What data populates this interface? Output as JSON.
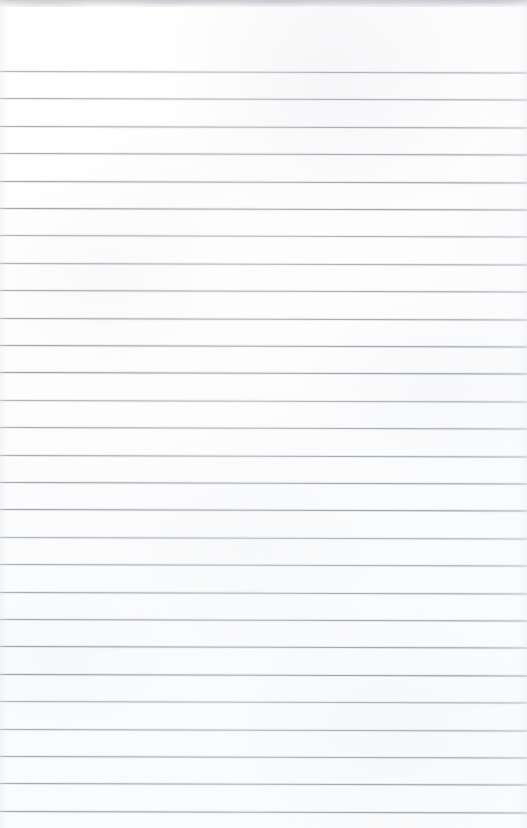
{
  "document": {
    "kind": "scanned-blank-ruled-page",
    "title": "Blank Ruled Notepad Page",
    "page_width": 527,
    "page_height": 828,
    "has_text": false,
    "has_handwriting": false,
    "text_content": "",
    "margin_rule": false,
    "hole_punches": false
  },
  "paper": {
    "background_color": "#fcfcfd",
    "highlight_color": "#ffffff",
    "shadow_tint": "#f7f8f9",
    "texture_opacity": 0.55
  },
  "rules": {
    "line_color": "#8f96a0",
    "line_thickness_px": 1,
    "count": 28,
    "first_line_y": 71,
    "last_line_y": 812,
    "spacing_px": 27.4,
    "skew_degrees": 0.16,
    "spans_full_width": true,
    "y_positions": [
      71,
      98.4,
      125.8,
      153.2,
      180.6,
      208,
      235.4,
      262.8,
      290.2,
      317.6,
      345,
      372.4,
      399.8,
      427.2,
      454.6,
      482,
      509.4,
      536.8,
      564.2,
      591.6,
      619,
      646.4,
      673.8,
      701.2,
      728.6,
      756,
      783.4,
      810.8
    ]
  },
  "scan_artifacts": {
    "top_edge_band": true,
    "top_edge_band_height_px": 6,
    "top_edge_band_color": "#c4c7cb",
    "side_vignette": true,
    "noise_speckle": true
  }
}
